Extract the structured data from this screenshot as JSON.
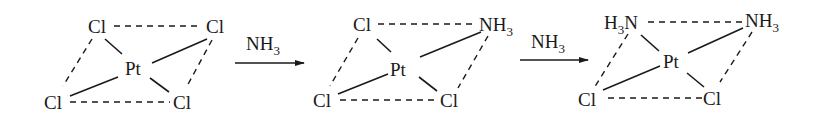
{
  "diagram": {
    "type": "reaction-scheme",
    "colors": {
      "ink": "#1a1a1a",
      "background": "#ffffff"
    },
    "steps": [
      {
        "name": "PtCl4",
        "center": "Pt",
        "ligands": {
          "top_left": "Cl",
          "top_right": "Cl",
          "bottom_left": "Cl",
          "bottom_right": "Cl"
        }
      },
      {
        "name": "PtCl3NH3",
        "center": "Pt",
        "ligands": {
          "top_left": "Cl",
          "top_right": "NH3",
          "bottom_left": "Cl",
          "bottom_right": "Cl"
        }
      },
      {
        "name": "PtCl2(NH3)2",
        "center": "Pt",
        "ligands": {
          "top_left": "H3N",
          "top_right": "NH3",
          "bottom_left": "Cl",
          "bottom_right": "Cl"
        }
      }
    ],
    "arrows": [
      {
        "reagent_main": "NH",
        "reagent_sub": "3"
      },
      {
        "reagent_main": "NH",
        "reagent_sub": "3"
      }
    ],
    "labels": {
      "m1": {
        "tl": "Cl",
        "tr": "Cl",
        "pt": "Pt",
        "bl": "Cl",
        "br": "Cl"
      },
      "m2": {
        "tl": "Cl",
        "tr_main": "NH",
        "tr_sub": "3",
        "pt": "Pt",
        "bl": "Cl",
        "br": "Cl"
      },
      "m3": {
        "tl_h": "H",
        "tl_sub": "3",
        "tl_n": "N",
        "tr_main": "NH",
        "tr_sub": "3",
        "pt": "Pt",
        "bl": "Cl",
        "br": "Cl"
      }
    }
  }
}
